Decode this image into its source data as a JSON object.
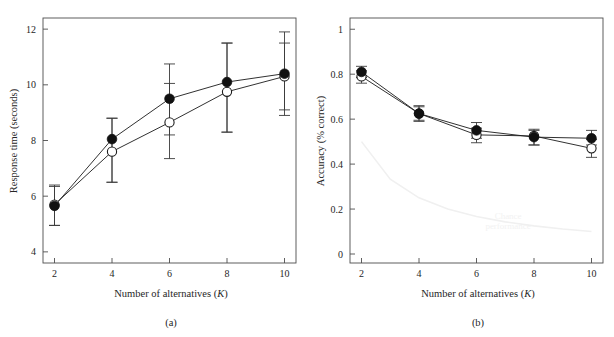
{
  "figure": {
    "panels": [
      {
        "id": "a",
        "caption": "(a)",
        "xlabel_main": "Number of alternatives (",
        "xlabel_sym": "K",
        "xlabel_tail": ")",
        "ylabel": "Response time (seconds)"
      },
      {
        "id": "b",
        "caption": "(b)",
        "xlabel_main": "Number of alternatives (",
        "xlabel_sym": "K",
        "xlabel_tail": ")",
        "ylabel": "Accuracy (% correct)"
      }
    ],
    "annotations": {
      "chance_line1": "Chance",
      "chance_line2": "performance"
    },
    "colors": {
      "filled_marker": "#111111",
      "open_marker_fill": "#ffffff",
      "line": "#1a1a1a",
      "frame": "#4d4d4d",
      "chance_curve": "#f0f0f0",
      "chance_text": "#f2f2f2",
      "background": "#ffffff"
    }
  },
  "chart_data": [
    {
      "type": "line",
      "panel": "a",
      "title": "",
      "xlabel": "Number of alternatives (K)",
      "ylabel": "Response time (seconds)",
      "x": [
        2,
        4,
        6,
        8,
        10
      ],
      "xlim": [
        1.6,
        10.4
      ],
      "ylim": [
        3.6,
        12.4
      ],
      "xticks": [
        2,
        4,
        6,
        8,
        10
      ],
      "xticklabels": [
        "2",
        "4",
        "6",
        "8",
        "10"
      ],
      "yticks": [
        4,
        6,
        8,
        10,
        12
      ],
      "yticklabels": [
        "4",
        "6",
        "8",
        "10",
        "12"
      ],
      "grid": false,
      "legend": "none",
      "series": [
        {
          "name": "filled-circles",
          "marker": "filled-circle",
          "values": [
            5.65,
            8.05,
            9.5,
            10.1,
            10.4
          ],
          "yerr_low": [
            0.7,
            1.55,
            1.3,
            1.8,
            1.5
          ],
          "yerr_high": [
            0.75,
            0.75,
            1.25,
            1.4,
            1.5
          ]
        },
        {
          "name": "open-circles",
          "marker": "open-circle",
          "values": [
            5.7,
            7.6,
            8.65,
            9.75,
            10.3
          ],
          "yerr_low": [
            0.75,
            1.1,
            1.3,
            1.45,
            1.2
          ],
          "yerr_high": [
            0.65,
            1.2,
            1.4,
            1.75,
            1.2
          ]
        }
      ]
    },
    {
      "type": "line",
      "panel": "b",
      "title": "",
      "xlabel": "Number of alternatives (K)",
      "ylabel": "Accuracy (% correct)",
      "x": [
        2,
        4,
        6,
        8,
        10
      ],
      "xlim": [
        1.6,
        10.4
      ],
      "ylim": [
        -0.04,
        1.05
      ],
      "xticks": [
        2,
        4,
        6,
        8,
        10
      ],
      "xticklabels": [
        "2",
        "4",
        "6",
        "8",
        "10"
      ],
      "yticks": [
        0,
        0.2,
        0.4,
        0.6,
        0.8,
        1
      ],
      "yticklabels": [
        "0",
        "0.2",
        "0.4",
        "0.6",
        "0.8",
        "1"
      ],
      "grid": false,
      "legend": "none",
      "series": [
        {
          "name": "filled-circles",
          "marker": "filled-circle",
          "values": [
            0.81,
            0.625,
            0.55,
            0.52,
            0.515
          ],
          "yerr_low": [
            0.025,
            0.035,
            0.035,
            0.035,
            0.03
          ],
          "yerr_high": [
            0.025,
            0.035,
            0.035,
            0.03,
            0.035
          ]
        },
        {
          "name": "open-circles",
          "marker": "open-circle",
          "values": [
            0.79,
            0.625,
            0.53,
            0.525,
            0.47
          ],
          "yerr_low": [
            0.03,
            0.03,
            0.035,
            0.04,
            0.04
          ],
          "yerr_high": [
            0.025,
            0.03,
            0.03,
            0.03,
            0.04
          ]
        },
        {
          "name": "chance-performance",
          "marker": "none",
          "x": [
            2,
            3,
            4,
            5,
            6,
            7,
            8,
            9,
            10
          ],
          "values": [
            0.5,
            0.333,
            0.25,
            0.2,
            0.167,
            0.143,
            0.125,
            0.111,
            0.1
          ]
        }
      ],
      "annotations": [
        {
          "text": "Chance performance",
          "x": 7.1,
          "y": 0.155
        }
      ]
    }
  ]
}
